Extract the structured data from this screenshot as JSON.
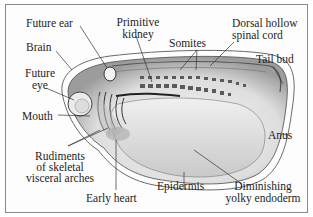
{
  "diagram": {
    "type": "anatomical-illustration",
    "labels": {
      "future_ear": "Future ear",
      "primitive_kidney_1": "Primitive",
      "primitive_kidney_2": "kidney",
      "somites": "Somites",
      "dorsal_cord_1": "Dorsal hollow",
      "dorsal_cord_2": "spinal cord",
      "brain": "Brain",
      "tail_bud": "Tail bud",
      "future_eye_1": "Future",
      "future_eye_2": "eye",
      "mouth": "Mouth",
      "anus": "Anus",
      "rudiments_1": "Rudiments",
      "rudiments_2": "of skeletal",
      "rudiments_3": "visceral arches",
      "early_heart": "Early heart",
      "epidermis": "Epidermis",
      "yolky_1": "Diminishing",
      "yolky_2": "yolky endoderm"
    },
    "colors": {
      "ink": "#1e1e1e",
      "border": "#8a8a8a",
      "shade": "#9a9a9a",
      "background": "#ffffff"
    }
  }
}
